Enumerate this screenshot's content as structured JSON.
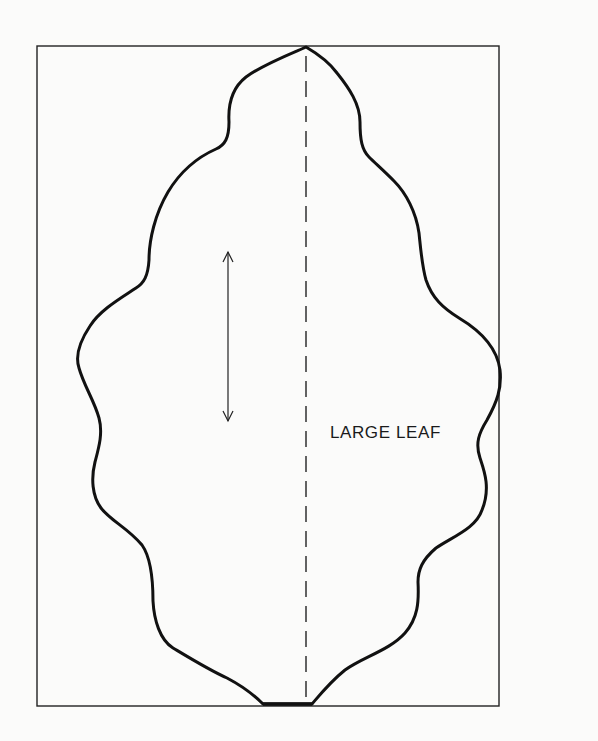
{
  "pattern": {
    "label": "LARGE LEAF",
    "colors": {
      "line": "#111111",
      "background": "#fbfbfa"
    },
    "elements": {
      "frame": "rectangle-border",
      "outline": "leaf-outline",
      "fold_line": "dashed-center-line",
      "grain_line": "double-headed-arrow"
    }
  }
}
